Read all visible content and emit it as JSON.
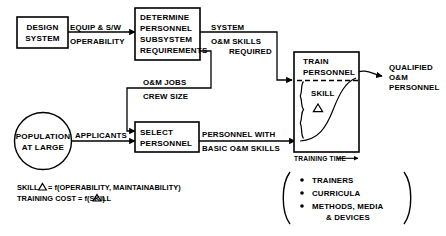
{
  "diagram": {
    "nodes": {
      "design_system": {
        "line1": "DESIGN",
        "line2": "SYSTEM"
      },
      "determine_requirements": {
        "line1": "DETERMINE",
        "line2": "PERSONNEL",
        "line3": "SUBSYSTEM",
        "line4": "REQUIREMENTS"
      },
      "select_personnel": {
        "line1": "SELECT",
        "line2": "PERSONNEL"
      },
      "train_personnel": {
        "line1": "TRAIN",
        "line2": "PERSONNEL"
      },
      "population": {
        "line1": "POPULATION",
        "line2": "AT LARGE"
      }
    },
    "edge_labels": {
      "equip_sw": "EQUIP & S/W",
      "operability": "OPERABILITY",
      "system": "SYSTEM",
      "om_skills": "O&M SKILLS",
      "required": "REQUIRED",
      "om_jobs": "O&M JOBS",
      "crew_size": "CREW SIZE",
      "applicants": "APPLICANTS",
      "personnel_with": "PERSONNEL WITH",
      "basic_om_skills": "BASIC O&M SKILLS",
      "qualified": "QUALIFIED",
      "qualified_om": "O&M",
      "qualified_personnel": "PERSONNEL"
    },
    "chart_inset": {
      "skill_label": "SKILL",
      "skill_delta": "△",
      "x_axis_label": "TRAINING TIME",
      "x_axis_arrow": "⟶"
    },
    "resources": {
      "items": [
        "TRAINERS",
        "CURRICULA",
        "METHODS, MEDIA",
        "& DEVICES"
      ]
    },
    "formulas": {
      "line1_a": "SKILL",
      "line1_delta": "△",
      "line1_b": "= f(OPERABILITY, MAINTAINABILITY)",
      "line2_a": "TRAINING COST  = f(SKILL",
      "line2_delta": "△",
      "line2_b": ")"
    },
    "colors": {
      "stroke": "#000000",
      "fill": "#ffffff",
      "background": "#ffffff"
    }
  }
}
